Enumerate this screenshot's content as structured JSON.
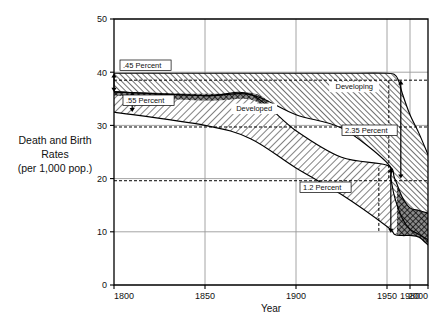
{
  "figure": {
    "ylabel_lines": [
      "Death and Birth",
      "Rates",
      "(per 1,000 pop.)"
    ],
    "xlabel": "Year"
  },
  "chart_data": {
    "type": "area",
    "title": "",
    "subtitle": "",
    "xlabel": "Year",
    "ylabel": "Death and Birth Rates (per 1,000 pop.)",
    "xlim": [
      1800,
      2000
    ],
    "ylim": [
      0,
      50
    ],
    "xticks": [
      1800,
      1850,
      1900,
      1950,
      1980,
      2000
    ],
    "xticklabels": [
      "1800",
      "1850",
      "1900",
      "1950",
      "1980",
      "2000"
    ],
    "yticks": [
      0,
      10,
      20,
      30,
      40,
      50
    ],
    "yticklabels": [
      "0",
      "10",
      "20",
      "30",
      "40",
      "50"
    ],
    "grid": true,
    "legend": "in-plot labels",
    "series": [
      {
        "name": "Developing birth rate",
        "role": "birth",
        "region": "Developing",
        "x": [
          1800,
          1850,
          1875,
          1900,
          1925,
          1950,
          1960,
          1965,
          1970,
          1980,
          1990,
          2000
        ],
        "values": [
          39.8,
          39.8,
          39.8,
          39.8,
          39.8,
          39.8,
          39.5,
          38.5,
          36.0,
          32.0,
          28.5,
          24.5
        ]
      },
      {
        "name": "Developing death rate",
        "role": "death",
        "region": "Developing",
        "x": [
          1800,
          1850,
          1875,
          1900,
          1925,
          1950,
          1955,
          1960,
          1970,
          1980,
          1990,
          2000
        ],
        "values": [
          36.3,
          35.6,
          35.8,
          32.0,
          29.5,
          23.0,
          20.0,
          16.5,
          12.5,
          10.5,
          9.5,
          8.5
        ]
      },
      {
        "name": "Developed birth rate",
        "role": "birth",
        "region": "Developed",
        "x": [
          1800,
          1850,
          1875,
          1900,
          1925,
          1950,
          1960,
          1970,
          1980,
          1990,
          2000
        ],
        "values": [
          36.3,
          35.6,
          35.8,
          29.0,
          24.0,
          22.5,
          20.0,
          16.5,
          14.5,
          14.0,
          13.5
        ]
      },
      {
        "name": "Developed death rate",
        "role": "death",
        "region": "Developed",
        "x": [
          1800,
          1850,
          1875,
          1900,
          1925,
          1950,
          1960,
          1970,
          1980,
          1990,
          2000
        ],
        "values": [
          32.5,
          30.0,
          27.5,
          22.0,
          17.0,
          11.0,
          9.5,
          9.3,
          9.3,
          9.0,
          7.5
        ]
      }
    ],
    "annotations": [
      {
        "label": ".45 Percent",
        "year": 1800,
        "from": 39.8,
        "to": 36.3,
        "note": "Developing natural increase, 1800"
      },
      {
        "label": ".55 Percent",
        "year": 1810,
        "from": 36.3,
        "to": 32.5,
        "note": "Developed natural increase, 1800"
      },
      {
        "label": "2.35 Percent",
        "year": 1968,
        "from": 38.5,
        "to": 20.0,
        "note": "Developing natural increase, peak"
      },
      {
        "label": "1.2 Percent",
        "year": 1955,
        "from": 22.0,
        "to": 9.8,
        "note": "Developed natural increase, mid-20th century"
      }
    ],
    "region_labels": [
      {
        "label": "Developing",
        "year": 1932,
        "value": 36.8
      },
      {
        "label": "Developed",
        "year": 1877,
        "value": 32.7
      }
    ],
    "dashed_reference_lines": [
      {
        "value": 38.5,
        "note": "Developing birth rate at 2.35 Percent marker"
      },
      {
        "value": 29.7,
        "note": "Developing reference"
      },
      {
        "value": 19.6,
        "note": "Developing death rate at 2.35 Percent marker"
      }
    ]
  }
}
